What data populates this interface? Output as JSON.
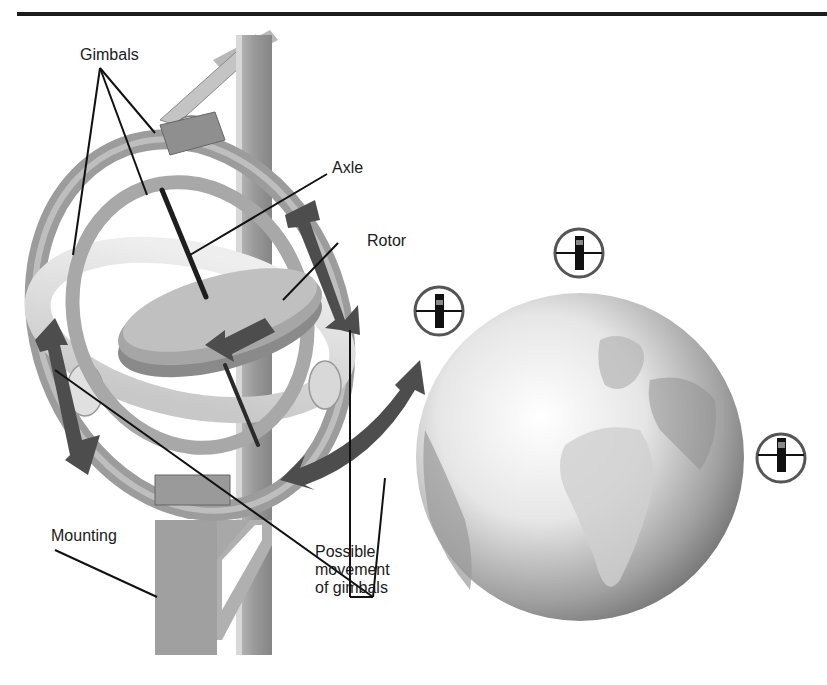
{
  "diagram": {
    "labels": {
      "gimbals": "Gimbals",
      "axle": "Axle",
      "rotor": "Rotor",
      "mounting": "Mounting",
      "movement_line1": "Possible",
      "movement_line2": "movement",
      "movement_line3": "of gimbals"
    },
    "gyroscope_indicators": [
      {
        "position": "top",
        "icon": "gyroscope-indicator-icon"
      },
      {
        "position": "left",
        "icon": "gyroscope-indicator-icon"
      },
      {
        "position": "right",
        "icon": "gyroscope-indicator-icon"
      }
    ],
    "colors": {
      "rule": "#1c1c1c",
      "metal_dark": "#7a7a7a",
      "metal_mid": "#a3a3a3",
      "metal_light": "#d4d4d4",
      "arrow": "#4d4d4d",
      "text": "#1a1a1a"
    }
  }
}
